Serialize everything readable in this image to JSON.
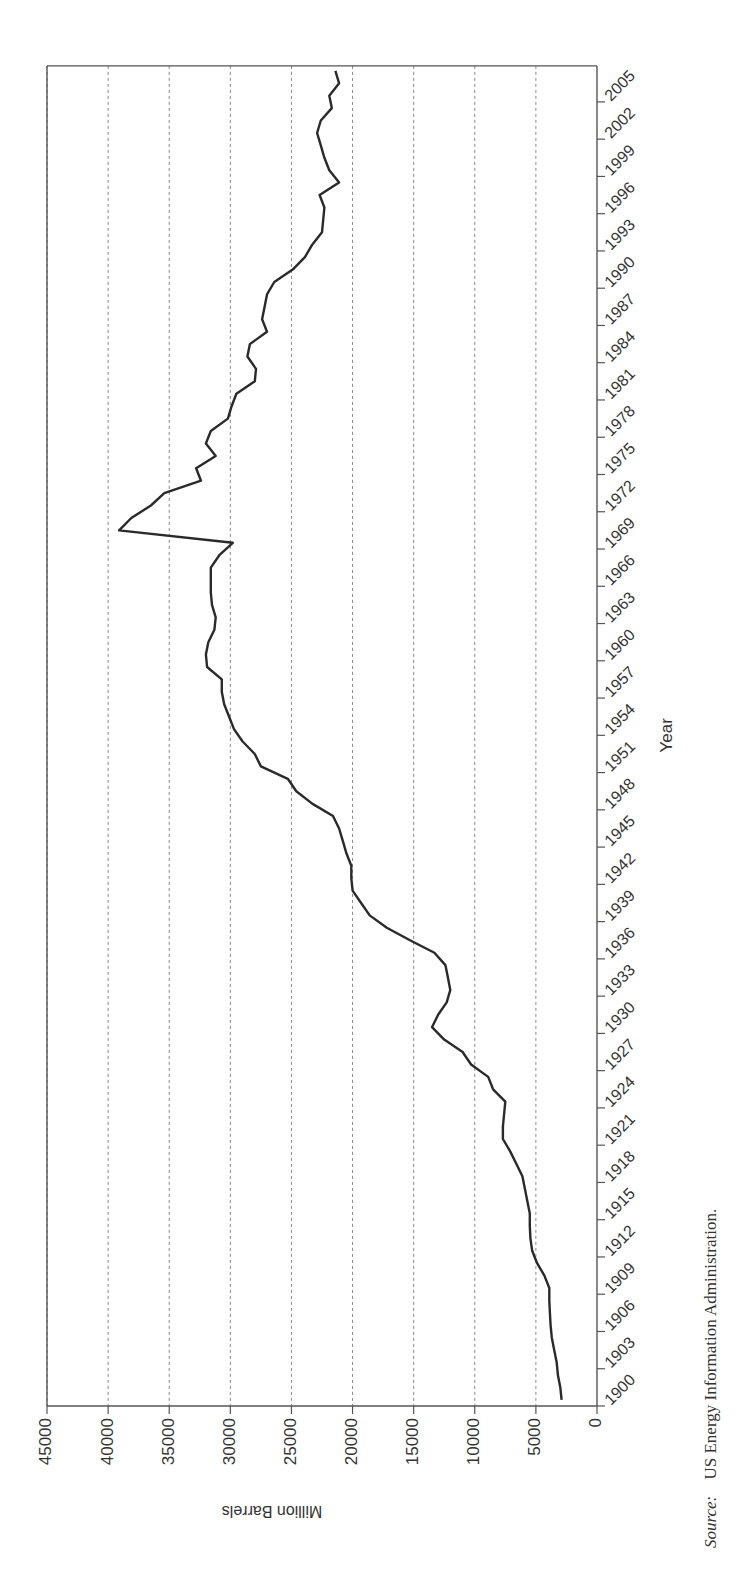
{
  "chart_data": {
    "type": "line",
    "title": "",
    "xlabel": "Year",
    "ylabel": "Million Barrels",
    "xlim": [
      1900,
      2008
    ],
    "ylim": [
      0,
      45000
    ],
    "x_ticks": [
      1900,
      1903,
      1906,
      1909,
      1912,
      1915,
      1918,
      1921,
      1924,
      1927,
      1930,
      1933,
      1936,
      1939,
      1942,
      1945,
      1948,
      1951,
      1954,
      1957,
      1960,
      1963,
      1966,
      1969,
      1972,
      1975,
      1978,
      1981,
      1984,
      1987,
      1990,
      1993,
      1996,
      1999,
      2002,
      2005
    ],
    "y_ticks": [
      0,
      5000,
      10000,
      15000,
      20000,
      25000,
      30000,
      35000,
      40000,
      45000
    ],
    "y_tick_labels": [
      "0",
      "5000",
      "10000",
      "15000",
      "20000",
      "25000",
      "30000",
      "35000",
      "40000",
      "45000"
    ],
    "grid": "horizontal dashed at each y tick",
    "legend": null,
    "orientation": "rotated 90 degrees on page",
    "series": [
      {
        "name": "US crude oil reserves",
        "x": [
          1900,
          1901,
          1902,
          1903,
          1904,
          1905,
          1906,
          1907,
          1908,
          1909,
          1910,
          1911,
          1912,
          1913,
          1914,
          1915,
          1916,
          1917,
          1918,
          1919,
          1920,
          1921,
          1922,
          1923,
          1924,
          1925,
          1926,
          1927,
          1928,
          1929,
          1930,
          1931,
          1932,
          1933,
          1934,
          1935,
          1936,
          1937,
          1938,
          1939,
          1940,
          1941,
          1942,
          1943,
          1944,
          1945,
          1946,
          1947,
          1948,
          1949,
          1950,
          1951,
          1952,
          1953,
          1954,
          1955,
          1956,
          1957,
          1958,
          1959,
          1960,
          1961,
          1962,
          1963,
          1964,
          1965,
          1966,
          1967,
          1968,
          1969,
          1970,
          1971,
          1972,
          1973,
          1974,
          1975,
          1976,
          1977,
          1978,
          1979,
          1980,
          1981,
          1982,
          1983,
          1984,
          1985,
          1986,
          1987,
          1988,
          1989,
          1990,
          1991,
          1992,
          1993,
          1994,
          1995,
          1996,
          1997,
          1998,
          1999,
          2000,
          2001,
          2002,
          2003,
          2004,
          2005,
          2006,
          2007
        ],
        "values": [
          2900,
          3000,
          3200,
          3300,
          3500,
          3700,
          3800,
          3850,
          3900,
          3900,
          4300,
          4900,
          5300,
          5450,
          5500,
          5500,
          5700,
          5900,
          6100,
          6600,
          7100,
          7700,
          7700,
          7600,
          7500,
          8500,
          8900,
          10300,
          11000,
          12500,
          13500,
          13000,
          12300,
          12000,
          12200,
          12400,
          13300,
          15300,
          17200,
          18600,
          19300,
          20000,
          20100,
          20100,
          20500,
          20800,
          21100,
          21600,
          23300,
          24600,
          25300,
          27500,
          28000,
          29000,
          29700,
          30100,
          30500,
          30700,
          30700,
          31900,
          32000,
          31800,
          31300,
          31200,
          31500,
          31600,
          31600,
          31600,
          30900,
          29800,
          39100,
          38100,
          36500,
          35400,
          32400,
          32800,
          31200,
          32000,
          31600,
          30200,
          29900,
          29500,
          28000,
          27900,
          28600,
          28400,
          27000,
          27400,
          27200,
          27000,
          26400,
          24900,
          23900,
          23300,
          22500,
          22400,
          22300,
          22700,
          21100,
          21900,
          22300,
          22600,
          22900,
          22600,
          21700,
          21900,
          21100,
          21400
        ]
      }
    ],
    "source_label": "Source:",
    "source_text": "US Energy Information Administration."
  }
}
